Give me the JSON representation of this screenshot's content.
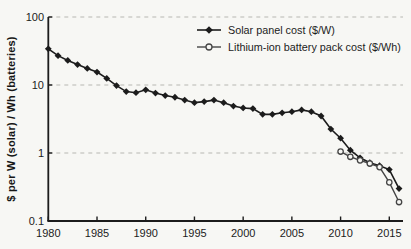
{
  "figure": {
    "background_color": "#f7f7f4",
    "axis_color": "#1c1c1c",
    "grid_color": "#b8b8b2",
    "solar_color": "#1c1c1c",
    "battery_color": "#454545"
  },
  "chart_data": {
    "type": "line",
    "title": "",
    "xlabel": "",
    "ylabel": "$ per W (solar) / Wh (batteries)",
    "y_scale": "log",
    "ylim": [
      0.1,
      100
    ],
    "xlim": [
      1980,
      2016.5
    ],
    "x_ticks": [
      1980,
      1985,
      1990,
      1995,
      2000,
      2005,
      2010,
      2015
    ],
    "y_ticks": [
      {
        "label": "100",
        "value": 100
      },
      {
        "label": "10",
        "value": 10
      },
      {
        "label": "1",
        "value": 1
      },
      {
        "label": "0.1",
        "value": 0.1
      }
    ],
    "grid": "horizontal dashed at 100, 10, 1",
    "legend_position": "top-center",
    "series": [
      {
        "name": "Solar panel cost ($/W)",
        "marker": "diamond-filled",
        "line_style": "solid",
        "years": [
          1980,
          1981,
          1982,
          1983,
          1984,
          1985,
          1986,
          1987,
          1988,
          1989,
          1990,
          1991,
          1992,
          1993,
          1994,
          1995,
          1996,
          1997,
          1998,
          1999,
          2000,
          2001,
          2002,
          2003,
          2004,
          2005,
          2006,
          2007,
          2008,
          2009,
          2010,
          2011,
          2012,
          2013,
          2014,
          2015,
          2016
        ],
        "values": [
          34,
          27,
          23,
          20,
          17.5,
          15.5,
          12.5,
          9.8,
          8.0,
          7.7,
          8.5,
          7.6,
          7.0,
          6.6,
          6.0,
          5.5,
          5.7,
          6.0,
          5.5,
          4.9,
          4.6,
          4.5,
          3.7,
          3.7,
          3.9,
          4.05,
          4.3,
          4.05,
          3.5,
          2.25,
          1.65,
          1.1,
          0.85,
          0.72,
          0.65,
          0.57,
          0.3
        ]
      },
      {
        "name": "Lithium-ion battery pack cost ($/Wh)",
        "marker": "circle-open",
        "line_style": "solid",
        "years": [
          2010,
          2011,
          2012,
          2013,
          2014,
          2015,
          2016
        ],
        "values": [
          1.05,
          0.88,
          0.78,
          0.7,
          0.62,
          0.37,
          0.19
        ]
      }
    ]
  }
}
